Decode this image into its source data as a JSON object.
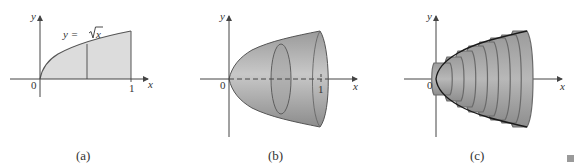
{
  "figure": {
    "panels": [
      {
        "id": "a",
        "caption": "(a)",
        "axis_labels": {
          "x": "x",
          "y": "y"
        },
        "ticks": {
          "origin": "0",
          "x_end": "1"
        },
        "curve_label_prefix": "y = ",
        "curve_label_radicand": "x",
        "description": "Region under y = sqrt(x) from 0 to 1, shaded, with a vertical strip line"
      },
      {
        "id": "b",
        "caption": "(b)",
        "axis_labels": {
          "x": "x",
          "y": "y"
        },
        "ticks": {
          "origin": "0",
          "x_end": "1"
        },
        "description": "Solid of revolution about the x-axis, with a cross-sectional disk"
      },
      {
        "id": "c",
        "caption": "(c)",
        "axis_labels": {
          "x": "x",
          "y": "y"
        },
        "ticks": {
          "origin": "0"
        },
        "description": "Approximation of the solid by stacked cylinders (disks) with the curve y = sqrt(x) overlaid"
      }
    ],
    "end_marker": "■",
    "colors": {
      "fill_light": "#dcdcdc",
      "solid_gray": "#a8a8a8",
      "stroke": "#555555",
      "axis": "#444444",
      "curve": "#1a1a1a"
    }
  }
}
